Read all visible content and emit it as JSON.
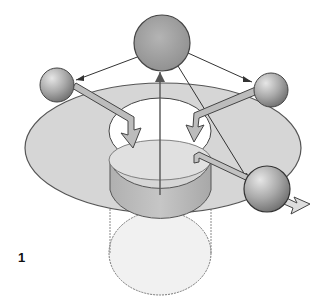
{
  "figure": {
    "label": "1"
  },
  "colors": {
    "background": "#ffffff",
    "disc_fill": "#d4d4d4",
    "disc_stroke": "#555555",
    "cylinder_fill": "#bdbdbd",
    "cylinder_bottom_fill": "#e8e8e8",
    "sphere_fill": "#a8a8a8",
    "sphere_stroke": "#444444",
    "arrow_fill": "#bcbcbc",
    "line": "#333333"
  }
}
